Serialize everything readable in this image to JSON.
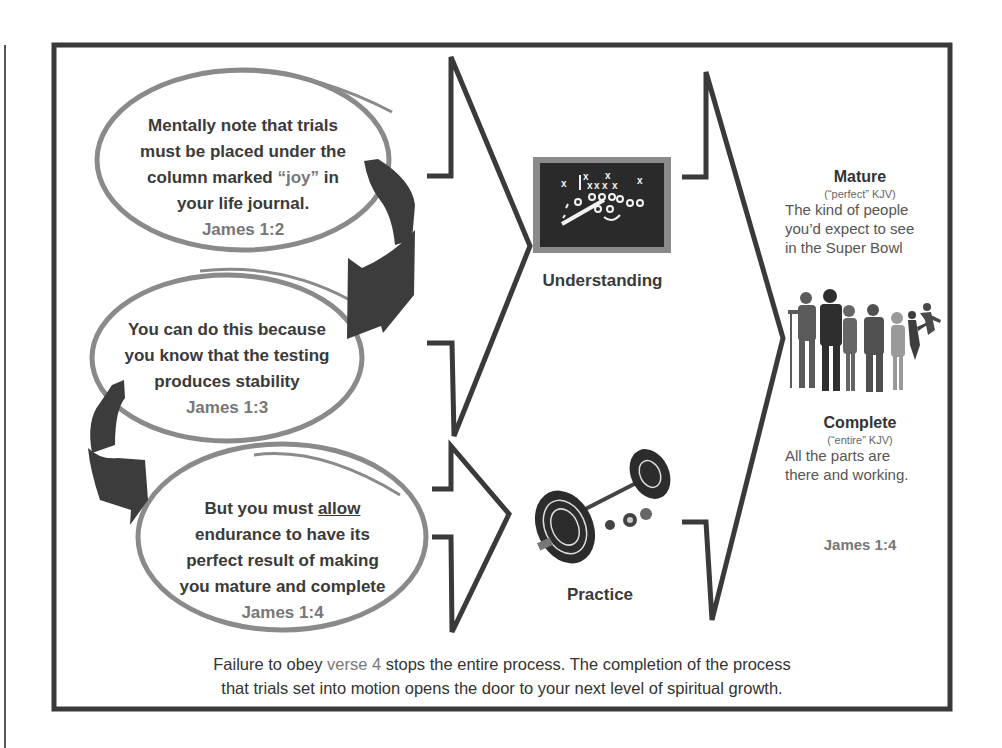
{
  "steps": [
    {
      "lines": [
        "Mentally note that trials",
        "must be placed under the"
      ],
      "line3_pre": "column marked ",
      "line3_highlight": "“joy”",
      "line3_post": " in",
      "line4": "your life journal.",
      "reference": "James 1:2"
    },
    {
      "lines": [
        "You can do this because",
        "you know that the testing",
        "produces stability"
      ],
      "reference": "James 1:3"
    },
    {
      "line1_pre": "But you must ",
      "line1_underlined": "allow",
      "lines": [
        "endurance to have its",
        "perfect result of making",
        "you mature and complete"
      ],
      "reference": "James 1:4"
    }
  ],
  "stages": [
    {
      "label": "Understanding",
      "icon": "blackboard-play-diagram"
    },
    {
      "label": "Practice",
      "icon": "barbell"
    }
  ],
  "outcomes": {
    "mature": {
      "title": "Mature",
      "kjv": "(“perfect” KJV)",
      "desc": [
        "The kind of people",
        "you’d expect to see",
        "in the Super Bowl"
      ]
    },
    "complete": {
      "title": "Complete",
      "kjv": "(“entire” KJV)",
      "desc": [
        "All the parts are",
        "there and working."
      ]
    },
    "reference": "James 1:4",
    "image": "people-silhouettes"
  },
  "footer": {
    "line1_pre": "Failure to obey ",
    "line1_highlight": "verse 4",
    "line1_post": " stops the entire process.  The completion of the process",
    "line2": "that trials set  into motion opens the door to your next level of spiritual growth."
  },
  "colors": {
    "frame": "#3a3a3a",
    "ellipse": "#8a8a8a",
    "arrow": "#3c3c3c",
    "text": "#333333",
    "reference": "#777777"
  }
}
